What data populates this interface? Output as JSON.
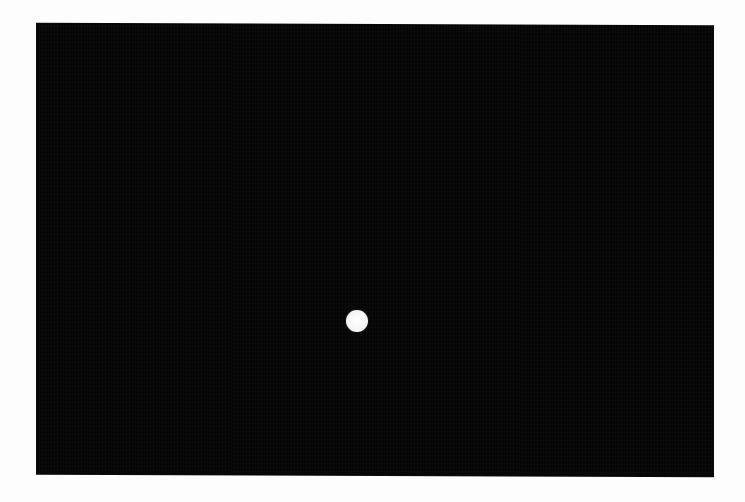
{
  "display": {
    "background_color": "#060606",
    "page_background": "#fdfdfd"
  },
  "stimulus": {
    "shape": "circle",
    "color": "#ffffff",
    "center_x": 357,
    "center_y": 321,
    "diameter": 22
  }
}
